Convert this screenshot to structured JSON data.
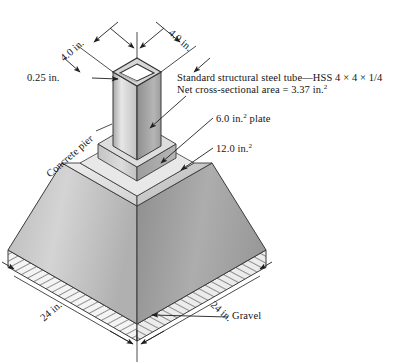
{
  "figure": {
    "labels": {
      "top_left_dim": "4.0 in.",
      "top_right_dim": "4.0 in.",
      "wall_thickness": "0.25 in.",
      "concrete_pier": "Concrete pier",
      "tube_note_line1": "Standard structural steel tube—HSS 4 × 4 × 1/4",
      "tube_note_line2_pre": "Net cross-sectional area = 3.37 in.",
      "tube_note_line2_sup": "2",
      "plate_pre": "6.0 in.",
      "plate_sup": "2",
      "plate_post": " plate",
      "pier_area_pre": "12.0 in.",
      "pier_area_sup": "2",
      "base_left_dim": "24 in.",
      "base_right_dim": "24 in.",
      "gravel": "Gravel"
    },
    "values": {
      "tube_width_in": 4.0,
      "tube_depth_in": 4.0,
      "wall_thickness_in": 0.25,
      "net_area_in2": 3.37,
      "plate_area_in2": 6.0,
      "pier_bearing_area_in2": 12.0,
      "base_width_in": 24,
      "base_depth_in": 24,
      "designation": "HSS 4 × 4 × 1/4"
    },
    "colors": {
      "tube_light": "#d9d9d9",
      "tube_mid": "#bdbdbd",
      "tube_dark": "#9a9a9a",
      "pier_left": "#c9c9c9",
      "pier_right": "#a3a3a3",
      "pier_top": "#e2e2e2",
      "gravel_fill": "#f2f2f2",
      "hatch": "#4a4a4a",
      "outline": "#3a3a3a",
      "leader": "#2b2b2b",
      "text": "#141414"
    },
    "icons": {
      "dimension_arrow": "arrow-icon",
      "leader_arrow": "leader-arrow-icon"
    }
  }
}
